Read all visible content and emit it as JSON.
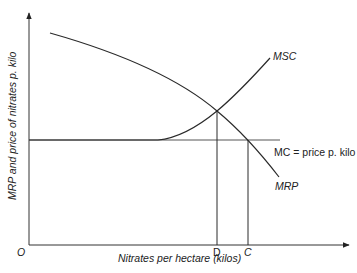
{
  "diagram": {
    "type": "economics-supply-demand",
    "axes": {
      "x_label": "Nitrates per hectare (kilos)",
      "y_label": "MRP and price of nitrates p. kilo",
      "origin_label": "O"
    },
    "curves": {
      "msc": "MSC",
      "mrp": "MRP",
      "mc": "MC = price p. kilo"
    },
    "points": {
      "d": "D",
      "c": "C"
    },
    "colors": {
      "line": "#2a2a2a",
      "mc_line": "#555555"
    }
  }
}
